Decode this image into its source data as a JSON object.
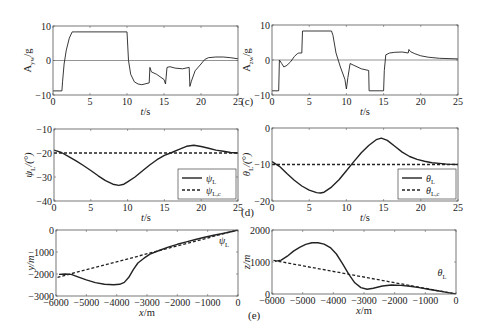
{
  "chart_data": [
    {
      "id": "c-left",
      "type": "line",
      "panel": "c",
      "title": "",
      "xlabel": "t/s",
      "ylabel": "A_yw/g",
      "xlim": [
        0,
        25
      ],
      "ylim": [
        -10,
        10
      ],
      "xticks": [
        0,
        5,
        10,
        15,
        20,
        25
      ],
      "yticks": [
        -10,
        0,
        10
      ],
      "frame": {
        "x": 53,
        "y": 26,
        "w": 185,
        "h": 69
      },
      "zero_line": true,
      "series": [
        {
          "name": "A_yw",
          "style": "solid",
          "x": [
            0,
            1.2,
            1.3,
            1.5,
            1.8,
            2.2,
            2.6,
            3,
            10,
            10.2,
            10.5,
            11,
            11.5,
            12,
            13,
            13.1,
            13.3,
            14,
            15,
            15.2,
            15.4,
            15.8,
            16.5,
            17.5,
            18.4,
            18.5,
            18.7,
            19.2,
            20,
            20.5,
            21,
            22,
            23,
            24,
            25
          ],
          "y": [
            -8.8,
            -8.8,
            -6,
            -1,
            3,
            6.5,
            8.3,
            8.3,
            8.3,
            0,
            -4,
            -6.2,
            -6.8,
            -7,
            -6.5,
            -2,
            -3.3,
            -4,
            -5.5,
            -6.8,
            -2,
            -1.8,
            -2.2,
            -2.4,
            -2,
            -7.5,
            -6,
            -3,
            -1,
            0.3,
            0.8,
            1,
            1,
            0.8,
            0.5
          ]
        }
      ]
    },
    {
      "id": "c-right",
      "type": "line",
      "panel": "c",
      "xlabel": "t/s",
      "ylabel": "A_zw/g",
      "xlim": [
        0,
        25
      ],
      "ylim": [
        -10,
        10
      ],
      "xticks": [
        0,
        5,
        10,
        15,
        20,
        25
      ],
      "yticks": [
        -10,
        0,
        10
      ],
      "frame": {
        "x": 272,
        "y": 25,
        "w": 186,
        "h": 70
      },
      "zero_line": true,
      "series": [
        {
          "name": "A_zw",
          "style": "solid",
          "x": [
            0,
            0.9,
            1,
            1.3,
            1.6,
            2,
            2.5,
            3,
            3.4,
            3.6,
            4,
            4.1,
            8,
            8.2,
            8.6,
            9.2,
            9.8,
            10,
            10.2,
            10.5,
            11,
            12,
            13,
            13.05,
            15,
            15.1,
            15.3,
            15.8,
            16.5,
            17.5,
            18.3,
            18.4,
            18.6,
            19.2,
            20,
            21,
            22.5,
            25
          ],
          "y": [
            -8.8,
            -8.8,
            0,
            -1,
            -2,
            -1.5,
            -0.5,
            1,
            1.8,
            2,
            2,
            8.3,
            8.3,
            7,
            2,
            -2,
            -5.5,
            -8.3,
            -5,
            -1,
            -1.5,
            -2.5,
            -3,
            -8.8,
            -8.8,
            -3,
            1.5,
            2,
            2.2,
            2.3,
            2,
            3,
            2.4,
            1.8,
            1.2,
            0.8,
            0.5,
            0.3
          ]
        }
      ]
    },
    {
      "id": "d-left",
      "type": "line",
      "panel": "d",
      "xlabel": "t/s",
      "ylabel": "ψ_L/(°)",
      "xlim": [
        0,
        25
      ],
      "ylim": [
        -40,
        -10
      ],
      "xticks": [
        0,
        5,
        10,
        15,
        20,
        25
      ],
      "yticks": [
        -40,
        -30,
        -20,
        -10
      ],
      "frame": {
        "x": 54,
        "y": 129,
        "w": 184,
        "h": 72
      },
      "legend": {
        "position": "lower right",
        "entries": [
          "ψ_L",
          "ψ_L,c"
        ]
      },
      "series": [
        {
          "name": "ψ_L",
          "style": "solid",
          "x": [
            0,
            1,
            2,
            3,
            4,
            5,
            6,
            7,
            8,
            8.8,
            9.5,
            10,
            11,
            12,
            13,
            14,
            15,
            16,
            17,
            18,
            19,
            20,
            21,
            22,
            23,
            24,
            25
          ],
          "y": [
            -18.8,
            -19.8,
            -21.5,
            -23.3,
            -25.2,
            -27.3,
            -29.5,
            -31.5,
            -33,
            -33.5,
            -33,
            -32,
            -30,
            -27.5,
            -25,
            -22.8,
            -21,
            -19.8,
            -18.5,
            -17.2,
            -16.8,
            -17.3,
            -18,
            -18.8,
            -19.3,
            -19.8,
            -20
          ]
        },
        {
          "name": "ψ_L,c",
          "style": "dashed",
          "x": [
            0,
            25
          ],
          "y": [
            -20,
            -20
          ]
        }
      ]
    },
    {
      "id": "d-right",
      "type": "line",
      "panel": "d",
      "xlabel": "t/s",
      "ylabel": "θ_L/(°)",
      "xlim": [
        0,
        25
      ],
      "ylim": [
        -20,
        0
      ],
      "xticks": [
        0,
        5,
        10,
        15,
        20,
        25
      ],
      "yticks": [
        -20,
        -10,
        0
      ],
      "frame": {
        "x": 272,
        "y": 128,
        "w": 186,
        "h": 73
      },
      "legend": {
        "position": "lower right",
        "entries": [
          "θ_L",
          "θ_L,c"
        ]
      },
      "series": [
        {
          "name": "θ_L",
          "style": "solid",
          "x": [
            0,
            1,
            2,
            3,
            4,
            5,
            6,
            6.5,
            7,
            8,
            9,
            10,
            11,
            12,
            13,
            14,
            14.7,
            15.5,
            16.5,
            17.5,
            18.5,
            19.5,
            20.5,
            21.5,
            22.5,
            23.5,
            25
          ],
          "y": [
            -9.2,
            -10.5,
            -12.5,
            -14.3,
            -15.9,
            -17,
            -17.7,
            -17.8,
            -17.6,
            -16.2,
            -14.2,
            -11.7,
            -9.2,
            -6.8,
            -4.8,
            -3.2,
            -2.8,
            -3.4,
            -5,
            -6.6,
            -7.8,
            -8.6,
            -9.1,
            -9.5,
            -9.7,
            -9.9,
            -10
          ]
        },
        {
          "name": "θ_L,c",
          "style": "dashed",
          "x": [
            0,
            25
          ],
          "y": [
            -10,
            -10
          ]
        }
      ]
    },
    {
      "id": "e-left",
      "type": "line",
      "panel": "e",
      "xlabel": "x/m",
      "ylabel": "y/m",
      "xlim": [
        -6000,
        0
      ],
      "ylim": [
        -3000,
        0
      ],
      "xticks": [
        -6000,
        -5000,
        -4000,
        -3000,
        -2000,
        -1000,
        0
      ],
      "yticks": [
        -3000,
        -2000,
        -1000,
        0
      ],
      "frame": {
        "x": 56,
        "y": 230,
        "w": 182,
        "h": 66
      },
      "annotation": "ψ_L",
      "series": [
        {
          "name": "trajectory",
          "style": "solid",
          "x": [
            -5900,
            -5700,
            -5500,
            -5300,
            -5000,
            -4700,
            -4400,
            -4100,
            -3900,
            -3750,
            -3600,
            -3450,
            -3300,
            -3100,
            -2900,
            -2600,
            -2300,
            -2000,
            -1700,
            -1400,
            -1100,
            -800,
            -500,
            -200,
            0
          ],
          "y": [
            -2020,
            -2000,
            -2020,
            -2120,
            -2270,
            -2390,
            -2470,
            -2490,
            -2470,
            -2380,
            -2150,
            -1800,
            -1500,
            -1280,
            -1100,
            -930,
            -780,
            -650,
            -540,
            -430,
            -330,
            -240,
            -160,
            -70,
            0
          ]
        },
        {
          "name": "line-of-sight",
          "style": "dashed",
          "x": [
            -5950,
            0
          ],
          "y": [
            -2150,
            0
          ]
        }
      ]
    },
    {
      "id": "e-right",
      "type": "line",
      "panel": "e",
      "xlabel": "x/m",
      "ylabel": "z/m",
      "xlim": [
        -6000,
        0
      ],
      "ylim": [
        0,
        2000
      ],
      "xticks": [
        -6000,
        -5000,
        -4000,
        -3000,
        -2000,
        -1000,
        0
      ],
      "yticks": [
        0,
        1000,
        2000
      ],
      "frame": {
        "x": 272,
        "y": 230,
        "w": 184,
        "h": 64
      },
      "annotation": "θ_L",
      "series": [
        {
          "name": "trajectory",
          "style": "solid",
          "x": [
            -5900,
            -5700,
            -5500,
            -5300,
            -5100,
            -4900,
            -4700,
            -4500,
            -4300,
            -4100,
            -3900,
            -3700,
            -3500,
            -3300,
            -3100,
            -2900,
            -2700,
            -2400,
            -2100,
            -1800,
            -1500,
            -1200,
            -900,
            -600,
            -300,
            0
          ],
          "y": [
            1020,
            1060,
            1180,
            1340,
            1460,
            1550,
            1600,
            1600,
            1560,
            1450,
            1250,
            950,
            620,
            350,
            200,
            150,
            180,
            250,
            280,
            270,
            240,
            200,
            150,
            100,
            50,
            0
          ]
        },
        {
          "name": "line-of-sight",
          "style": "dashed",
          "x": [
            -5950,
            0
          ],
          "y": [
            1050,
            0
          ]
        }
      ]
    }
  ],
  "labels": {
    "panel_c": "(c)",
    "panel_d": "(d)",
    "panel_e": "(e)"
  }
}
